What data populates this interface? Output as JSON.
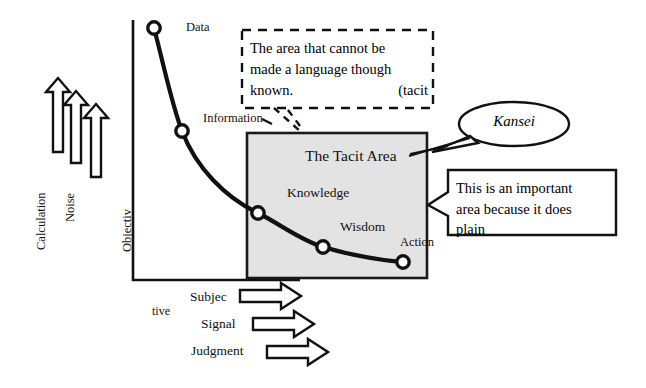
{
  "diagram": {
    "axes": {
      "y_label": "Objectiv",
      "x_labels": [
        "Subjec",
        "tive"
      ]
    },
    "curve_points": [
      {
        "label": "Data",
        "x": 154,
        "y": 28
      },
      {
        "label": "Information",
        "x": 182,
        "y": 131
      },
      {
        "label": "Knowledge",
        "x": 258,
        "y": 213
      },
      {
        "label": "Wisdom",
        "x": 323,
        "y": 247
      },
      {
        "label": "Action",
        "x": 403,
        "y": 262
      }
    ],
    "stage_labels": {
      "data": "Data",
      "information": "Information",
      "knowledge": "Knowledge",
      "wisdom": "Wisdom",
      "action": "Action"
    },
    "shaded_box": {
      "label": "The Tacit Area",
      "fill_color": "#e2e2e2",
      "stroke_color": "#1a1a1a"
    },
    "left_arrows": [
      {
        "label": "Calculation"
      },
      {
        "label": "Noise"
      },
      {
        "label": "Objectiv"
      }
    ],
    "bottom_arrows": [
      {
        "label": "Subjec"
      },
      {
        "label": "Signal"
      },
      {
        "label": "Judgment"
      }
    ],
    "callouts": {
      "tacit_note": {
        "line1": "The area that cannot be",
        "line2": "made a language though",
        "line3_left": "known.",
        "line3_right": "(tacit",
        "border_style": "dashed"
      },
      "kansei_bubble": {
        "text": "Kansei",
        "style": "italic-oval"
      },
      "important_note": {
        "line1": "This is an important",
        "line2": "area because it does",
        "line3": "plain",
        "border_style": "solid"
      }
    },
    "colors": {
      "ink": "#111111",
      "shade": "#e2e2e2",
      "background": "#ffffff"
    }
  }
}
